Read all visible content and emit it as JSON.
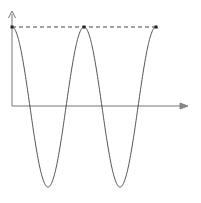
{
  "diagram": {
    "colors": {
      "curve": "#555555",
      "axes": "#777777",
      "dashed": "#444444",
      "background": "#ffffff"
    },
    "curve": {
      "type": "cosine",
      "x_start": 12,
      "period_px": 72,
      "peak_y": 27,
      "trough_y": 187,
      "x_end": 158
    },
    "maxima_points": [
      [
        12,
        27
      ],
      [
        84,
        27
      ],
      [
        156,
        27
      ]
    ],
    "axes": {
      "origin": [
        12,
        106
      ],
      "y_axis_top": 12,
      "x_axis_right": 188
    }
  }
}
